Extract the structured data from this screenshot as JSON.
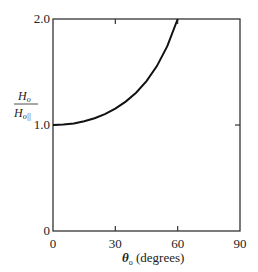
{
  "chart_data": {
    "type": "line",
    "title": "",
    "xlabel": "θ₀ (degrees)",
    "xlabel_parts": {
      "symbol": "θ",
      "subscript": "o",
      "rest": " (degrees)"
    },
    "ylabel": "H₀ / H₀||",
    "ylabel_parts": {
      "numerator": "H",
      "num_sub": "o",
      "denominator": "H",
      "den_sub": "o||"
    },
    "xlim": [
      0,
      90
    ],
    "ylim": [
      0,
      2.0
    ],
    "xticks": [
      0,
      30,
      60,
      90
    ],
    "xtick_labels": [
      "0",
      "30",
      "60",
      "90"
    ],
    "yticks": [
      0,
      1.0,
      2.0
    ],
    "ytick_labels": [
      "0",
      "1.0",
      "2.0"
    ],
    "grid": false,
    "series": [
      {
        "name": "H0/H0||",
        "x": [
          0,
          5,
          10,
          15,
          20,
          25,
          30,
          35,
          40,
          45,
          50,
          55,
          60
        ],
        "y": [
          1.0,
          1.004,
          1.015,
          1.035,
          1.064,
          1.103,
          1.155,
          1.221,
          1.305,
          1.414,
          1.556,
          1.743,
          2.0
        ]
      }
    ]
  }
}
